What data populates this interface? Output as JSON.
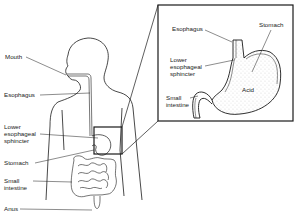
{
  "figure": {
    "body_labels": {
      "mouth": "Mouth",
      "esophagus": "Esophagus",
      "lower_esophageal_sphincter": "Lower\nesophageal\nsphincter",
      "stomach": "Stomach",
      "small_intestine": "Small\nintestine",
      "anus": "Anus"
    },
    "inset_labels": {
      "esophagus": "Esophagus",
      "stomach": "Stomach",
      "lower_esophageal_sphincter": "Lower\nesophageal\nsphincter",
      "acid": "Acid",
      "small_intestine": "Small\nintestine"
    },
    "colors": {
      "line": "#1a1a1a",
      "background": "#ffffff",
      "stipple": "#555555"
    }
  }
}
